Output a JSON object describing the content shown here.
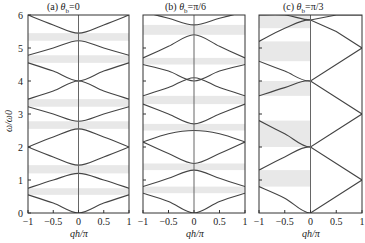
{
  "chart_data": [
    {
      "type": "line",
      "title": "(a) θb=0",
      "panel": "a",
      "xlabel": "qh/π",
      "ylabel": "ω/ω0",
      "xlim": [
        -1,
        1
      ],
      "ylim": [
        0,
        6
      ],
      "xticks": [
        "-1",
        "-0.5",
        "0",
        "0.5",
        "1"
      ],
      "yticks": [
        "0",
        "1",
        "2",
        "3",
        "4",
        "5",
        "6"
      ],
      "band_gaps_shaded": [
        [
          0.55,
          0.75
        ],
        [
          1.2,
          1.45
        ],
        [
          2.55,
          2.78
        ],
        [
          3.22,
          3.45
        ],
        [
          4.55,
          4.78
        ],
        [
          5.22,
          5.45
        ]
      ],
      "series": [
        {
          "name": "band1",
          "x": [
            -1,
            -0.5,
            0,
            0.5,
            1
          ],
          "y": [
            0.55,
            0.3,
            0.0,
            0.3,
            0.55
          ]
        },
        {
          "name": "band2",
          "x": [
            -1,
            -0.5,
            0,
            0.5,
            1
          ],
          "y": [
            0.75,
            1.0,
            1.2,
            1.0,
            0.75
          ]
        },
        {
          "name": "band3",
          "x": [
            -1,
            -0.5,
            0,
            0.5,
            1
          ],
          "y": [
            2.0,
            1.7,
            1.45,
            1.7,
            2.0
          ]
        },
        {
          "name": "band4",
          "x": [
            -1,
            -0.5,
            0,
            0.5,
            1
          ],
          "y": [
            2.0,
            2.3,
            2.55,
            2.3,
            2.0
          ]
        },
        {
          "name": "band5",
          "x": [
            -1,
            -0.5,
            0,
            0.5,
            1
          ],
          "y": [
            3.22,
            3.0,
            2.78,
            3.0,
            3.22
          ]
        },
        {
          "name": "band6",
          "x": [
            -1,
            -0.5,
            0,
            0.5,
            1
          ],
          "y": [
            3.45,
            3.7,
            4.0,
            3.7,
            3.45
          ]
        },
        {
          "name": "band7",
          "x": [
            -1,
            -0.5,
            0,
            0.5,
            1
          ],
          "y": [
            4.55,
            4.3,
            4.0,
            4.3,
            4.55
          ]
        },
        {
          "name": "band8",
          "x": [
            -1,
            -0.5,
            0,
            0.5,
            1
          ],
          "y": [
            4.78,
            5.0,
            5.22,
            5.0,
            4.78
          ]
        },
        {
          "name": "band9",
          "x": [
            -1,
            -0.5,
            0,
            0.5,
            1
          ],
          "y": [
            6.0,
            5.7,
            5.45,
            5.7,
            6.0
          ]
        }
      ]
    },
    {
      "type": "line",
      "title": "(b) θb=π/6",
      "panel": "b",
      "xlabel": "qh/π",
      "xlim": [
        -1,
        1
      ],
      "ylim": [
        0,
        6
      ],
      "xticks": [
        "-1",
        "-0.5",
        "0",
        "0.5",
        "1"
      ],
      "band_gaps_shaded": [
        [
          0.6,
          0.8
        ],
        [
          1.3,
          1.5
        ],
        [
          2.5,
          2.7
        ],
        [
          3.3,
          3.55
        ],
        [
          4.5,
          4.7
        ],
        [
          5.4,
          5.7
        ]
      ],
      "series": [
        {
          "name": "band1",
          "x": [
            -1,
            -0.5,
            0,
            0.5,
            1
          ],
          "y": [
            0.6,
            0.35,
            0.0,
            0.35,
            0.6
          ]
        },
        {
          "name": "band2",
          "x": [
            -1,
            -0.5,
            0,
            0.5,
            1
          ],
          "y": [
            0.8,
            1.05,
            1.3,
            1.05,
            0.8
          ]
        },
        {
          "name": "band3",
          "x": [
            -1,
            -0.5,
            0,
            0.5,
            1
          ],
          "y": [
            2.15,
            1.8,
            1.5,
            1.8,
            2.15
          ]
        },
        {
          "name": "band4",
          "x": [
            -1,
            -0.5,
            0,
            0.5,
            1
          ],
          "y": [
            2.15,
            2.4,
            2.5,
            2.4,
            2.15
          ]
        },
        {
          "name": "band5",
          "x": [
            -1,
            -0.5,
            0,
            0.5,
            1
          ],
          "y": [
            3.3,
            3.0,
            2.7,
            3.0,
            3.3
          ]
        },
        {
          "name": "band6",
          "x": [
            -1,
            -0.5,
            0,
            0.5,
            1
          ],
          "y": [
            3.55,
            3.8,
            4.1,
            3.8,
            3.55
          ]
        },
        {
          "name": "band7",
          "x": [
            -1,
            -0.5,
            0,
            0.5,
            1
          ],
          "y": [
            4.5,
            4.3,
            4.0,
            4.3,
            4.5
          ]
        },
        {
          "name": "band8",
          "x": [
            -1,
            -0.5,
            0,
            0.5,
            1
          ],
          "y": [
            4.7,
            5.05,
            5.4,
            5.05,
            4.7
          ]
        },
        {
          "name": "band9",
          "x": [
            -1,
            -0.5,
            0,
            0.5,
            1
          ],
          "y": [
            6.1,
            5.9,
            5.7,
            5.9,
            6.1
          ]
        }
      ]
    },
    {
      "type": "line",
      "title": "(c) θb=π/3",
      "panel": "c",
      "xlabel": "qh/π",
      "xlim": [
        -1,
        1
      ],
      "ylim": [
        0,
        6
      ],
      "xticks": [
        "-1",
        "-0.5",
        "0",
        "0.5",
        "1"
      ],
      "band_gaps_shaded": [
        [
          0.8,
          1.3
        ],
        [
          2.0,
          2.8
        ],
        [
          3.55,
          4.0
        ],
        [
          4.6,
          5.2
        ],
        [
          5.6,
          6.0
        ]
      ],
      "series": [
        {
          "name": "band1",
          "x": [
            -1,
            -0.5,
            0,
            0.5,
            1
          ],
          "y": [
            0.8,
            0.45,
            0.0,
            0.5,
            1.0
          ]
        },
        {
          "name": "band2",
          "x": [
            -1,
            -0.5,
            0,
            0.5,
            1
          ],
          "y": [
            1.3,
            1.7,
            2.0,
            1.5,
            1.0
          ]
        },
        {
          "name": "band3",
          "x": [
            -1,
            -0.5,
            0,
            0.5,
            1
          ],
          "y": [
            2.8,
            2.4,
            2.0,
            2.5,
            3.0
          ]
        },
        {
          "name": "band4",
          "x": [
            -1,
            -0.5,
            0,
            0.5,
            1
          ],
          "y": [
            3.55,
            3.8,
            4.0,
            3.5,
            3.0
          ]
        },
        {
          "name": "band5",
          "x": [
            -1,
            -0.5,
            0,
            0.5,
            1
          ],
          "y": [
            4.6,
            4.3,
            4.0,
            4.5,
            5.0
          ]
        },
        {
          "name": "band6",
          "x": [
            -1,
            -0.5,
            0,
            0.5,
            1
          ],
          "y": [
            5.2,
            5.6,
            5.85,
            5.5,
            5.0
          ]
        },
        {
          "name": "band7",
          "x": [
            -1,
            -0.5,
            0,
            0.5,
            1
          ],
          "y": [
            6.0,
            6.0,
            5.85,
            6.0,
            6.0
          ]
        }
      ]
    }
  ],
  "labels": {
    "panel_a_title": "(a) θb=0",
    "panel_b_title": "(b) θb=π/6",
    "panel_c_title": "(c) θb=π/3",
    "xlabel": "qh/π",
    "ylabel": "ω/ω0"
  }
}
